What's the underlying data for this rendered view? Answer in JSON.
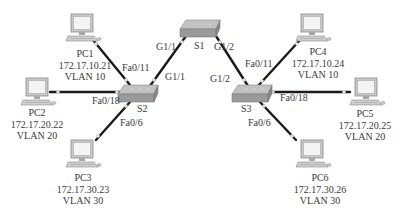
{
  "diagram": {
    "type": "network-topology",
    "switches": [
      {
        "id": "S1",
        "label": "S1"
      },
      {
        "id": "S2",
        "label": "S2"
      },
      {
        "id": "S3",
        "label": "S3"
      }
    ],
    "pcs": [
      {
        "id": "PC1",
        "name": "PC1",
        "ip": "172.17.10.21",
        "vlan": "VLAN 10"
      },
      {
        "id": "PC2",
        "name": "PC2",
        "ip": "172.17.20.22",
        "vlan": "VLAN 20"
      },
      {
        "id": "PC3",
        "name": "PC3",
        "ip": "172.17.30.23",
        "vlan": "VLAN 30"
      },
      {
        "id": "PC4",
        "name": "PC4",
        "ip": "172.17.10.24",
        "vlan": "VLAN 10"
      },
      {
        "id": "PC5",
        "name": "PC5",
        "ip": "172.17.20.25",
        "vlan": "VLAN 20"
      },
      {
        "id": "PC6",
        "name": "PC6",
        "ip": "172.17.30.26",
        "vlan": "VLAN 30"
      }
    ],
    "links": [
      {
        "from": "S1",
        "from_port": "G1/1",
        "to": "S2",
        "to_port": "G1/1"
      },
      {
        "from": "S1",
        "from_port": "G1/2",
        "to": "S3",
        "to_port": "G1/2"
      },
      {
        "from": "S2",
        "from_port": "Fa0/11",
        "to": "PC1"
      },
      {
        "from": "S2",
        "from_port": "Fa0/18",
        "to": "PC2"
      },
      {
        "from": "S2",
        "from_port": "Fa0/6",
        "to": "PC3"
      },
      {
        "from": "S3",
        "from_port": "Fa0/11",
        "to": "PC4"
      },
      {
        "from": "S3",
        "from_port": "Fa0/18",
        "to": "PC5"
      },
      {
        "from": "S3",
        "from_port": "Fa0/6",
        "to": "PC6"
      }
    ],
    "port_labels": {
      "s1_g11": "G1/1",
      "s1_g12": "G1/2",
      "s2_g11": "G1/1",
      "s2_fa011": "Fa0/11",
      "s2_fa018": "Fa0/18",
      "s2_fa06": "Fa0/6",
      "s3_g12": "G1/2",
      "s3_fa011": "Fa0/11",
      "s3_fa018": "Fa0/18",
      "s3_fa06": "Fa0/6"
    },
    "colors": {
      "link": "#1a1a1a",
      "switch_top": "#bdbdbd",
      "switch_side": "#8e8e8e",
      "pc_body": "#c8c8c8",
      "pc_screen": "#f2f2f2"
    }
  }
}
